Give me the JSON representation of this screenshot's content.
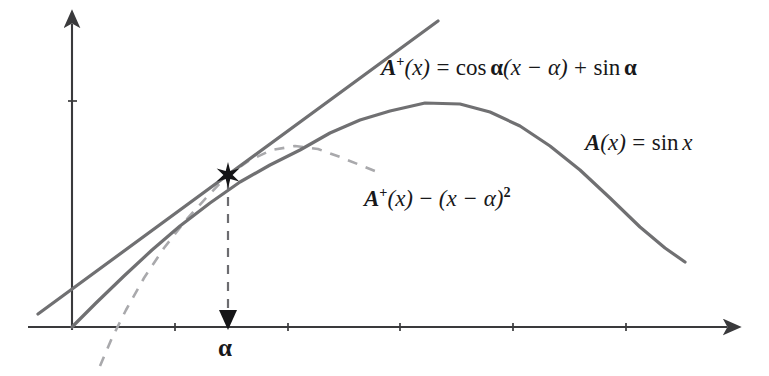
{
  "figure": {
    "title_text": "",
    "background_color": "#ffffff",
    "axis_color": "#3a3a3c",
    "curve_color": "#707072",
    "dashed_color": "#a9a9ac",
    "text_color": "#18181a"
  },
  "labels": {
    "tangent_line": {
      "fn": "A",
      "sup": "+",
      "arg": "(x)",
      "eq": "=",
      "cos": "cos",
      "alpha1": "α",
      "term": "(x − α)",
      "plus": "+",
      "sin": "sin",
      "alpha2": "α",
      "full_text": "A+(x) = cos α(x − α) + sin α"
    },
    "sine_curve": {
      "fn": "A",
      "arg": "(x)",
      "eq": "=",
      "sin": "sin",
      "var": "x",
      "full_text": "A(x) = sin x"
    },
    "dashed_curve": {
      "fn": "A",
      "sup": "+",
      "arg": "(x)",
      "minus": "−",
      "term": "(x − α)",
      "exp": "2",
      "full_text": "A+(x) − (x − α)²"
    },
    "alpha_axis_mark": "α"
  },
  "chart_data": {
    "type": "line",
    "title": "",
    "xlabel": "",
    "ylabel": "",
    "grid": false,
    "legend_position": "inline-annotations",
    "axes": {
      "x_axis": {
        "pixel_y": 327,
        "pixel_x_start": 28,
        "pixel_x_end": 733,
        "arrow_end": "right",
        "tick_pixel_xs": [
          175,
          288,
          400,
          513,
          626
        ]
      },
      "y_axis": {
        "pixel_x": 72,
        "pixel_y_start": 330,
        "pixel_y_end": 18,
        "arrow_end": "top",
        "tick_pixel_ys": [
          101
        ]
      }
    },
    "alpha": {
      "x_pixel": 228,
      "y_pixel_on_curve": 175,
      "marker": "star",
      "axis_arrow": "down-triangle",
      "label": "α"
    },
    "series": [
      {
        "name": "A(x) = sin x",
        "style": "solid",
        "color": "#707072",
        "width": 3.2,
        "points_pixel": [
          [
            72,
            327
          ],
          [
            96,
            303
          ],
          [
            124,
            276
          ],
          [
            152,
            250
          ],
          [
            180,
            226
          ],
          [
            210,
            203
          ],
          [
            240,
            182
          ],
          [
            270,
            165
          ],
          [
            300,
            150
          ],
          [
            330,
            133
          ],
          [
            360,
            120
          ],
          [
            390,
            111
          ],
          [
            425,
            103
          ],
          [
            460,
            104
          ],
          [
            490,
            112
          ],
          [
            520,
            126
          ],
          [
            550,
            146
          ],
          [
            580,
            170
          ],
          [
            610,
            198
          ],
          [
            640,
            227
          ],
          [
            665,
            248
          ],
          [
            685,
            262
          ]
        ]
      },
      {
        "name": "A+(x) = cos α(x − α) + sin α",
        "style": "solid",
        "color": "#707072",
        "width": 3.2,
        "points_pixel": [
          [
            38,
            314
          ],
          [
            228,
            175
          ],
          [
            438,
            21
          ]
        ]
      },
      {
        "name": "A+(x) − (x − α)²",
        "style": "dashed",
        "color": "#a9a9ac",
        "width": 2.6,
        "dash_pattern": "10 9",
        "points_pixel": [
          [
            100,
            366
          ],
          [
            112,
            338
          ],
          [
            126,
            310
          ],
          [
            144,
            278
          ],
          [
            164,
            248
          ],
          [
            186,
            220
          ],
          [
            206,
            198
          ],
          [
            228,
            175
          ],
          [
            250,
            160
          ],
          [
            272,
            150
          ],
          [
            295,
            146
          ],
          [
            318,
            149
          ],
          [
            340,
            157
          ],
          [
            360,
            165
          ],
          [
            375,
            171
          ]
        ]
      },
      {
        "name": "alpha-dashed-drop",
        "style": "dashed",
        "color": "#6c6c70",
        "width": 2.2,
        "dash_pattern": "9 8",
        "points_pixel": [
          [
            228,
            180
          ],
          [
            228,
            318
          ]
        ]
      }
    ]
  }
}
